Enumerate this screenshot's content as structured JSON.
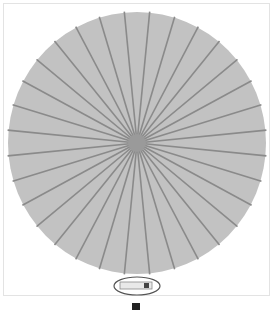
{
  "figure": {
    "canopy": {
      "center": [
        137,
        143
      ],
      "rx": 129,
      "ry": 131,
      "fill": "#c2c2c2",
      "rib_color": "#8a8a8a",
      "rib_count": 32
    },
    "handle_callout": {
      "label": "handle",
      "ellipse_center": [
        137,
        286
      ],
      "ellipse_rx": 23,
      "ellipse_ry": 9,
      "outline_color": "#555555"
    },
    "frame_border_color": "#e3e3e3"
  },
  "caption": {
    "text": ""
  }
}
